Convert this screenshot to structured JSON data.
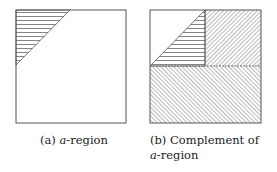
{
  "figures": [
    {
      "id": "a",
      "label": "(a)",
      "caption_math": "a",
      "caption_rest": "-region",
      "regions": [
        {
          "name": "a-region",
          "shape": "triangle",
          "hatch": "horizontal"
        }
      ]
    },
    {
      "id": "b",
      "label": "(b)",
      "caption_prefix": "Complement of ",
      "caption_math": "a",
      "caption_rest": "-region",
      "regions": [
        {
          "name": "a-region",
          "shape": "triangle",
          "hatch": "horizontal"
        },
        {
          "name": "top-right-quadrant",
          "shape": "rectangle",
          "hatch": "diagonal-backslash"
        },
        {
          "name": "bottom-half",
          "shape": "rectangle",
          "hatch": "diagonal-slash"
        }
      ]
    }
  ],
  "colors": {
    "stroke": "#555555",
    "hatch": "#666666",
    "text": "#222222"
  }
}
